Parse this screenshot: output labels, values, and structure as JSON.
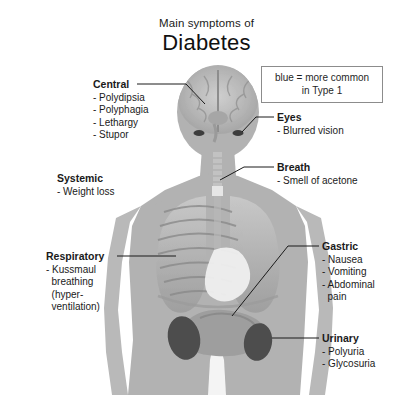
{
  "title": {
    "line1": "Main symptoms of",
    "line2": "Diabetes"
  },
  "legend": {
    "line1": "blue = more common",
    "line2": "in Type 1"
  },
  "labels": {
    "central": {
      "heading": "Central",
      "items": [
        "- Polydipsia",
        "- Polyphagia",
        "- Lethargy",
        "- Stupor"
      ]
    },
    "eyes": {
      "heading": "Eyes",
      "items": [
        "- Blurred vision"
      ]
    },
    "breath": {
      "heading": "Breath",
      "items": [
        "- Smell of acetone"
      ]
    },
    "systemic": {
      "heading": "Systemic",
      "items": [
        "- Weight loss"
      ]
    },
    "respiratory": {
      "heading": "Respiratory",
      "items": [
        "- Kussmaul",
        "  breathing",
        "  (hyper-",
        "  ventilation)"
      ]
    },
    "gastric": {
      "heading": "Gastric",
      "items": [
        "- Nausea",
        "- Vomiting",
        "- Abdominal",
        "  pain"
      ]
    },
    "urinary": {
      "heading": "Urinary",
      "items": [
        "- Polyuria",
        "- Glycosuria"
      ]
    }
  },
  "colors": {
    "background": "#ffffff",
    "body_silhouette": "#b0b0b0",
    "organ_dark": "#4a4a4a",
    "text": "#1a1a1a",
    "legend_border": "#8c8c8c",
    "leader_line": "#1a1a1a"
  },
  "anatomy": {
    "regions": [
      "head-brain",
      "eyes",
      "trachea",
      "lungs",
      "heart",
      "ribcage",
      "stomach-intestine",
      "kidney-left",
      "kidney-right"
    ]
  }
}
